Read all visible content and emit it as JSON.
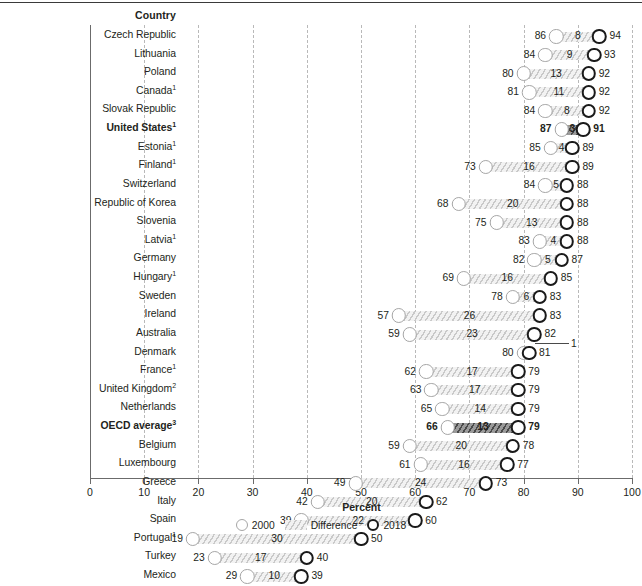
{
  "header": {
    "country_column_label": "Country"
  },
  "axis": {
    "title": "Percent",
    "ticks": [
      0,
      10,
      20,
      30,
      40,
      50,
      60,
      70,
      80,
      90,
      100
    ],
    "min": 0,
    "max": 100
  },
  "legend": {
    "items": [
      {
        "key": "y2000",
        "label": "2000",
        "marker": "open-circle-gray"
      },
      {
        "key": "difference",
        "label": "Difference",
        "marker": "hatched-bar"
      },
      {
        "key": "y2018",
        "label": "2018",
        "marker": "open-circle-black"
      }
    ]
  },
  "colors": {
    "marker_2000": "#a6a6a6",
    "marker_2018": "#1a1a1a",
    "hatch_light": "#c9c9c9",
    "hatch_bg": "#f2f2f2",
    "highlight_hatch": "#4a4a4a",
    "gridline": "#b9b9b9",
    "axis": "#6b6b6b",
    "text": "#231f20"
  },
  "chart_data": {
    "type": "bar",
    "title": "",
    "subtitle": "",
    "xlabel": "Percent",
    "ylabel": "Country",
    "xlim": [
      0,
      100
    ],
    "grid": true,
    "legend_position": "bottom",
    "series": [
      {
        "name": "2000",
        "marker": "open-circle-gray"
      },
      {
        "name": "Difference",
        "marker": "hatched-bar"
      },
      {
        "name": "2018",
        "marker": "open-circle-black"
      }
    ],
    "categories": [
      "Czech Republic",
      "Lithuania",
      "Poland",
      "Canada",
      "Slovak Republic",
      "United States",
      "Estonia",
      "Finland",
      "Switzerland",
      "Republic of Korea",
      "Slovenia",
      "Latvia",
      "Germany",
      "Hungary",
      "Sweden",
      "Ireland",
      "Australia",
      "Denmark",
      "France",
      "United Kingdom",
      "Netherlands",
      "OECD average",
      "Belgium",
      "Luxembourg",
      "Greece",
      "Italy",
      "Spain",
      "Portugal",
      "Turkey",
      "Mexico"
    ],
    "rows": [
      {
        "country": "Czech Republic",
        "footnote": "",
        "bold": false,
        "v2000": 86,
        "v2018": 94,
        "diff": 8,
        "diff_leader": false
      },
      {
        "country": "Lithuania",
        "footnote": "",
        "bold": false,
        "v2000": 84,
        "v2018": 93,
        "diff": 9,
        "diff_leader": false
      },
      {
        "country": "Poland",
        "footnote": "",
        "bold": false,
        "v2000": 80,
        "v2018": 92,
        "diff": 13,
        "diff_leader": false
      },
      {
        "country": "Canada",
        "footnote": "1",
        "bold": false,
        "v2000": 81,
        "v2018": 92,
        "diff": 11,
        "diff_leader": false
      },
      {
        "country": "Slovak Republic",
        "footnote": "",
        "bold": false,
        "v2000": 84,
        "v2018": 92,
        "diff": 8,
        "diff_leader": false
      },
      {
        "country": "United States",
        "footnote": "1",
        "bold": true,
        "v2000": 87,
        "v2018": 91,
        "diff": 3,
        "diff_leader": false
      },
      {
        "country": "Estonia",
        "footnote": "1",
        "bold": false,
        "v2000": 85,
        "v2018": 89,
        "diff": 4,
        "diff_leader": false
      },
      {
        "country": "Finland",
        "footnote": "1",
        "bold": false,
        "v2000": 73,
        "v2018": 89,
        "diff": 16,
        "diff_leader": false
      },
      {
        "country": "Switzerland",
        "footnote": "",
        "bold": false,
        "v2000": 84,
        "v2018": 88,
        "diff": 5,
        "diff_leader": false
      },
      {
        "country": "Republic of Korea",
        "footnote": "",
        "bold": false,
        "v2000": 68,
        "v2018": 88,
        "diff": 20,
        "diff_leader": false
      },
      {
        "country": "Slovenia",
        "footnote": "",
        "bold": false,
        "v2000": 75,
        "v2018": 88,
        "diff": 13,
        "diff_leader": false
      },
      {
        "country": "Latvia",
        "footnote": "1",
        "bold": false,
        "v2000": 83,
        "v2018": 88,
        "diff": 4,
        "diff_leader": false
      },
      {
        "country": "Germany",
        "footnote": "",
        "bold": false,
        "v2000": 82,
        "v2018": 87,
        "diff": 5,
        "diff_leader": false
      },
      {
        "country": "Hungary",
        "footnote": "1",
        "bold": false,
        "v2000": 69,
        "v2018": 85,
        "diff": 16,
        "diff_leader": false
      },
      {
        "country": "Sweden",
        "footnote": "",
        "bold": false,
        "v2000": 78,
        "v2018": 83,
        "diff": 6,
        "diff_leader": false
      },
      {
        "country": "Ireland",
        "footnote": "",
        "bold": false,
        "v2000": 57,
        "v2018": 83,
        "diff": 26,
        "diff_leader": false
      },
      {
        "country": "Australia",
        "footnote": "",
        "bold": false,
        "v2000": 59,
        "v2018": 82,
        "diff": 23,
        "diff_leader": false
      },
      {
        "country": "Denmark",
        "footnote": "",
        "bold": false,
        "v2000": 80,
        "v2018": 81,
        "diff": 1,
        "diff_leader": true
      },
      {
        "country": "France",
        "footnote": "1",
        "bold": false,
        "v2000": 62,
        "v2018": 79,
        "diff": 17,
        "diff_leader": false
      },
      {
        "country": "United Kingdom",
        "footnote": "2",
        "bold": false,
        "v2000": 63,
        "v2018": 79,
        "diff": 17,
        "diff_leader": false
      },
      {
        "country": "Netherlands",
        "footnote": "",
        "bold": false,
        "v2000": 65,
        "v2018": 79,
        "diff": 14,
        "diff_leader": false
      },
      {
        "country": "OECD average",
        "footnote": "3",
        "bold": true,
        "v2000": 66,
        "v2018": 79,
        "diff": 13,
        "diff_leader": false
      },
      {
        "country": "Belgium",
        "footnote": "",
        "bold": false,
        "v2000": 59,
        "v2018": 78,
        "diff": 20,
        "diff_leader": false
      },
      {
        "country": "Luxembourg",
        "footnote": "",
        "bold": false,
        "v2000": 61,
        "v2018": 77,
        "diff": 16,
        "diff_leader": false
      },
      {
        "country": "Greece",
        "footnote": "",
        "bold": false,
        "v2000": 49,
        "v2018": 73,
        "diff": 24,
        "diff_leader": false
      },
      {
        "country": "Italy",
        "footnote": "",
        "bold": false,
        "v2000": 42,
        "v2018": 62,
        "diff": 20,
        "diff_leader": false
      },
      {
        "country": "Spain",
        "footnote": "",
        "bold": false,
        "v2000": 39,
        "v2018": 60,
        "diff": 22,
        "diff_leader": false
      },
      {
        "country": "Portugal",
        "footnote": "1",
        "bold": false,
        "v2000": 19,
        "v2018": 50,
        "diff": 30,
        "diff_leader": false
      },
      {
        "country": "Turkey",
        "footnote": "",
        "bold": false,
        "v2000": 23,
        "v2018": 40,
        "diff": 17,
        "diff_leader": false
      },
      {
        "country": "Mexico",
        "footnote": "",
        "bold": false,
        "v2000": 29,
        "v2018": 39,
        "diff": 10,
        "diff_leader": false
      }
    ]
  }
}
